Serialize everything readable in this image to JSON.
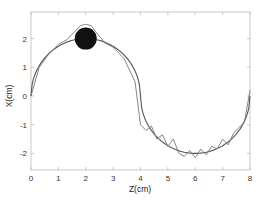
{
  "chart_data": {
    "type": "line",
    "title": "",
    "xlabel": "Z(cm)",
    "ylabel": "X(cm)",
    "xlim": [
      0,
      8
    ],
    "ylim": [
      -2.6,
      2.9
    ],
    "xticks": [
      0,
      1,
      2,
      3,
      4,
      5,
      6,
      7,
      8
    ],
    "yticks": [
      -2,
      -1,
      0,
      1,
      2
    ],
    "grid": false,
    "legend": null,
    "series": [
      {
        "name": "reference-path",
        "style": "smooth solid",
        "color": "#555555",
        "description": "Two semicircles: up from (0,0) peaking at (2,2) to (4,0), then down to minimum (6,-2) and back to (8,0)",
        "x": [
          0,
          0.5,
          1,
          1.5,
          2,
          2.5,
          3,
          3.5,
          4,
          4.5,
          5,
          5.5,
          6,
          6.5,
          7,
          7.5,
          8
        ],
        "y": [
          0,
          1.32,
          1.73,
          1.94,
          2.0,
          1.94,
          1.73,
          1.32,
          0,
          -1.32,
          -1.73,
          -1.94,
          -2.0,
          -1.94,
          -1.73,
          -1.32,
          0
        ]
      },
      {
        "name": "tracked-trajectory",
        "style": "oscillating solid",
        "color": "#777777",
        "description": "Noisy trajectory following the reference, bulging over the obstacle to ~2.5 near Z=2 and oscillating ±0.2 in the lower arc",
        "x": [
          0,
          0.3,
          0.6,
          1.0,
          1.3,
          1.6,
          1.8,
          2.0,
          2.2,
          2.4,
          2.7,
          3.0,
          3.4,
          3.8,
          4.0,
          4.2,
          4.4,
          4.6,
          4.8,
          5.0,
          5.2,
          5.4,
          5.6,
          5.8,
          6.0,
          6.2,
          6.4,
          6.6,
          6.8,
          7.0,
          7.2,
          7.4,
          7.6,
          7.8,
          8.0
        ],
        "y": [
          0,
          1.0,
          1.4,
          1.8,
          1.95,
          2.25,
          2.45,
          2.5,
          2.45,
          2.2,
          1.85,
          1.7,
          1.3,
          0.5,
          -1.0,
          -1.2,
          -1.05,
          -1.5,
          -1.35,
          -1.75,
          -1.5,
          -2.0,
          -2.1,
          -1.9,
          -2.15,
          -1.85,
          -2.05,
          -1.75,
          -1.85,
          -1.5,
          -1.7,
          -1.3,
          -1.1,
          -0.9,
          0.2
        ]
      }
    ],
    "annotations": [
      {
        "type": "filled-circle",
        "label": "obstacle",
        "center": [
          2.0,
          2.0
        ],
        "radius_cm": 0.4,
        "color": "#111111"
      }
    ]
  }
}
